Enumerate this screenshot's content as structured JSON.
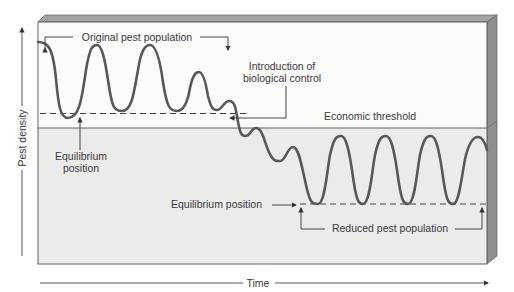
{
  "diagram": {
    "labels": {
      "original_population": "Original pest population",
      "introduction_line1": "Introduction of",
      "introduction_line2": "biological control",
      "economic_threshold": "Economic threshold",
      "equilibrium_upper_line1": "Equilibrium",
      "equilibrium_upper_line2": "position",
      "equilibrium_lower": "Equilibrium position",
      "reduced_population": "Reduced pest population"
    },
    "axes": {
      "y_label": "Pest density",
      "x_label": "Time"
    },
    "colors": {
      "upper_region": "#fbfbfa",
      "lower_region": "#ebebea",
      "bevel": "#9a9a98",
      "curve": "#555555",
      "text": "#3a3a3a"
    }
  }
}
